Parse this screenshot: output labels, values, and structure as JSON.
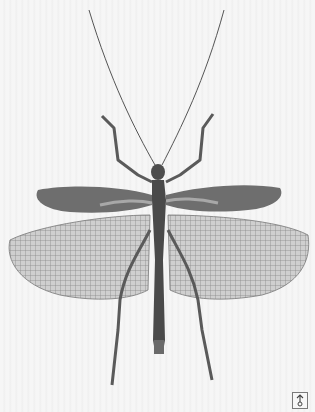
{
  "image": {
    "subject": "winged stick insect specimen",
    "colors": {
      "background": "#f4f4f4",
      "body": "#4a4a4a",
      "forewing": "#6a6a6a",
      "hindwing_mesh": "#8a8a8a",
      "hindwing_fill": "#c9c9c9"
    }
  },
  "corner_button": {
    "icon": "arrow-up-circle-icon",
    "border_color": "#7a7a7a"
  }
}
